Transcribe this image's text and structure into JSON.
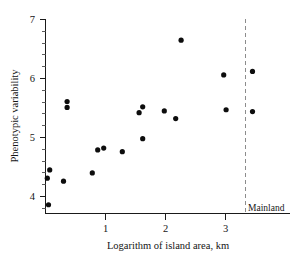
{
  "chart_data": {
    "type": "scatter",
    "title": "",
    "xlabel": "Logarithm of island area, km",
    "ylabel": "Phenotypic variability",
    "xlim": [
      -0.2,
      3.75
    ],
    "ylim": [
      3.8,
      7.0
    ],
    "grid": false,
    "legend": "none",
    "x_ticks": [
      1,
      2,
      3
    ],
    "x_tick_labels": [
      "1",
      "2",
      "3"
    ],
    "y_ticks": [
      4,
      5,
      6,
      7
    ],
    "y_tick_labels": [
      "4",
      "5",
      "6",
      "7"
    ],
    "y_minor_step": 0.2,
    "annotations": [
      {
        "text": "Mainland",
        "x": 3.28,
        "y": 3.86,
        "type": "label"
      },
      {
        "text": "",
        "x": 3.28,
        "type": "vertical-dashed-line"
      }
    ],
    "points": [
      {
        "x": 0.07,
        "y": 4.45
      },
      {
        "x": 0.03,
        "y": 4.31
      },
      {
        "x": 0.05,
        "y": 3.86
      },
      {
        "x": 0.3,
        "y": 4.26
      },
      {
        "x": 0.36,
        "y": 5.61
      },
      {
        "x": 0.36,
        "y": 5.51
      },
      {
        "x": 0.78,
        "y": 4.4
      },
      {
        "x": 0.87,
        "y": 4.79
      },
      {
        "x": 0.97,
        "y": 4.82
      },
      {
        "x": 1.28,
        "y": 4.76
      },
      {
        "x": 1.56,
        "y": 5.42
      },
      {
        "x": 1.62,
        "y": 5.52
      },
      {
        "x": 1.62,
        "y": 4.98
      },
      {
        "x": 1.98,
        "y": 5.45
      },
      {
        "x": 2.17,
        "y": 5.32
      },
      {
        "x": 2.26,
        "y": 6.65
      },
      {
        "x": 2.97,
        "y": 6.06
      },
      {
        "x": 3.01,
        "y": 5.47
      },
      {
        "x": 3.45,
        "y": 6.12
      },
      {
        "x": 3.45,
        "y": 5.44
      }
    ]
  },
  "labels": {
    "x_axis_title": "Logarithm of island area, km",
    "y_axis_title": "Phenotypic variability",
    "mainland": "Mainland",
    "x1": "1",
    "x2": "2",
    "x3": "3",
    "y4": "4",
    "y5": "5",
    "y6": "6",
    "y7": "7"
  },
  "colors": {
    "point": "#0d0d0d",
    "axis": "#1a1a1a",
    "divider": "#8c8c8c",
    "background": "#ffffff"
  }
}
